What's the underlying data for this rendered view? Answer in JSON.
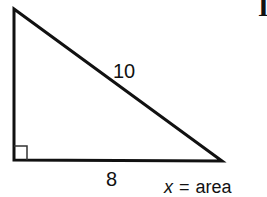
{
  "figure": {
    "type": "right-triangle",
    "vertices": {
      "top": [
        14,
        9
      ],
      "right_angle": [
        14,
        160
      ],
      "bottom_right": [
        222,
        161
      ]
    },
    "right_angle_marker": true,
    "stroke_color": "#111111"
  },
  "labels": {
    "hypotenuse": "10",
    "base": "8",
    "variable": "x",
    "equals": "=",
    "unknown_meaning": "area"
  },
  "corner_text": "I"
}
